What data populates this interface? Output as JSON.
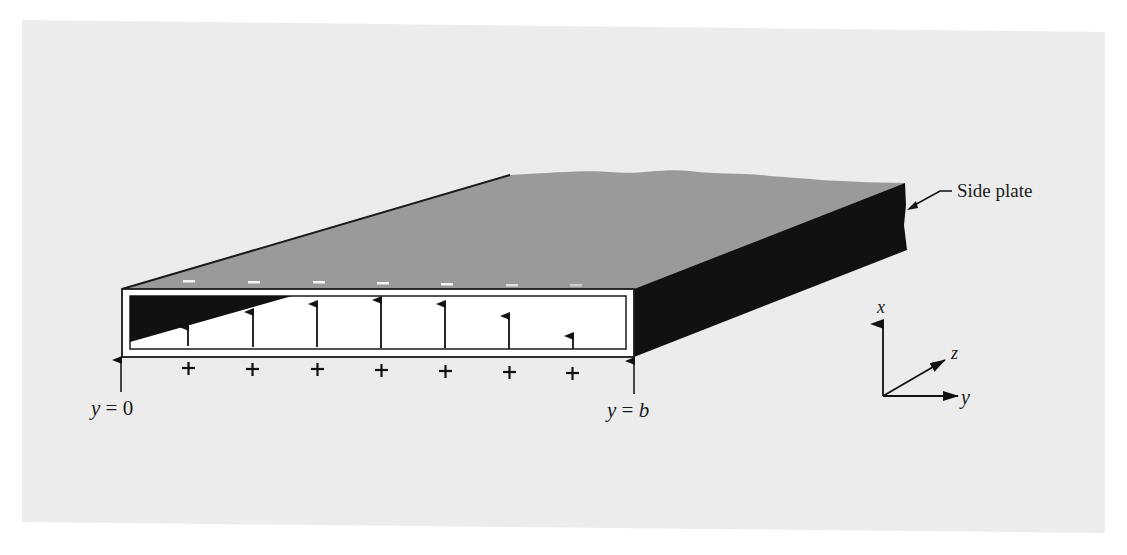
{
  "figure": {
    "colors": {
      "page_background": "#ffffff",
      "panel_background": "#ececec",
      "top_plate": "#9a9a9a",
      "side_plate": "#111111",
      "front_face": "#ffffff",
      "outline": "#1a1a1a"
    }
  },
  "labels": {
    "side_plate": "Side plate",
    "y_zero": {
      "var": "y",
      "eq": " = ",
      "val": "0"
    },
    "y_b": {
      "var": "y",
      "eq": " = ",
      "val": "b"
    },
    "axes": {
      "x": "x",
      "y": "y",
      "z": "z"
    }
  },
  "field": {
    "surface_charge_top": [
      "−",
      "−",
      "−",
      "−",
      "−",
      "−",
      "−"
    ],
    "surface_charge_bottom": [
      "+",
      "+",
      "+",
      "+",
      "+",
      "+",
      "+"
    ],
    "arrow_positions_x": [
      188,
      253,
      317,
      381,
      445,
      509,
      573
    ],
    "arrow_tip_y": [
      327,
      312,
      304,
      300,
      304,
      316,
      336
    ],
    "arrow_base_y": [
      346,
      347,
      347,
      348,
      348,
      349,
      349
    ]
  }
}
